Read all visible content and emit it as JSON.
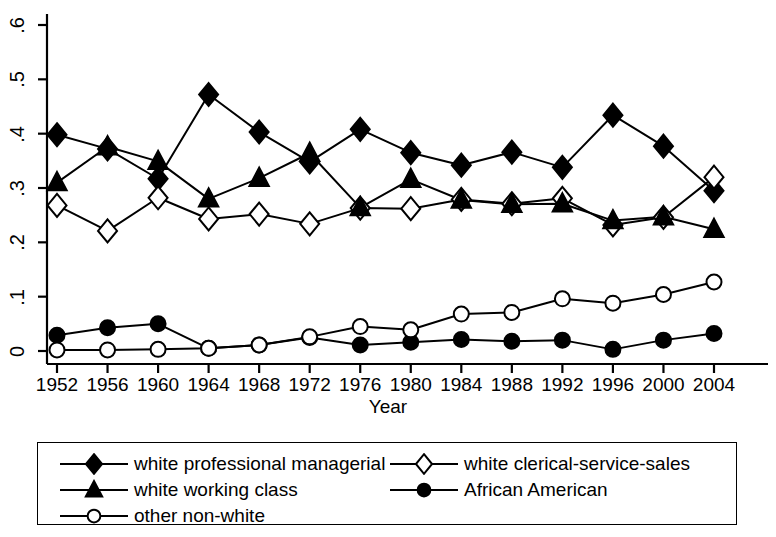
{
  "chart_data": {
    "type": "line",
    "title": "",
    "xlabel": "Year",
    "ylabel": "",
    "x": [
      1952,
      1956,
      1960,
      1964,
      1968,
      1972,
      1976,
      1980,
      1984,
      1988,
      1992,
      1996,
      2000,
      2004
    ],
    "xticklabels": [
      "1952",
      "1956",
      "1960",
      "1964",
      "1968",
      "1972",
      "1976",
      "1980",
      "1984",
      "1988",
      "1992",
      "1996",
      "2000",
      "2004"
    ],
    "yticklabels": [
      "0",
      ".1",
      ".2",
      ".3",
      ".4",
      ".5",
      ".6"
    ],
    "ytickvalues": [
      0,
      0.1,
      0.2,
      0.3,
      0.4,
      0.5,
      0.6
    ],
    "ylim": [
      0,
      0.6
    ],
    "xlim": [
      1952,
      2004
    ],
    "grid": false,
    "legend_position": "below-plot",
    "series": [
      {
        "name": "white professional managerial",
        "marker": "filled-diamond",
        "values": [
          0.398,
          0.372,
          0.317,
          0.472,
          0.403,
          0.348,
          0.408,
          0.365,
          0.342,
          0.366,
          0.338,
          0.434,
          0.377,
          0.295
        ]
      },
      {
        "name": "white clerical-service-sales",
        "marker": "open-diamond",
        "values": [
          0.268,
          0.221,
          0.282,
          0.243,
          0.252,
          0.234,
          0.263,
          0.262,
          0.279,
          0.271,
          0.281,
          0.232,
          0.246,
          0.32
        ]
      },
      {
        "name": "white working class",
        "marker": "filled-triangle",
        "values": [
          0.31,
          0.376,
          0.349,
          0.28,
          0.318,
          0.364,
          0.264,
          0.316,
          0.278,
          0.27,
          0.271,
          0.24,
          0.247,
          0.224
        ]
      },
      {
        "name": "African American",
        "marker": "filled-circle",
        "values": [
          0.029,
          0.043,
          0.05,
          0.005,
          0.011,
          0.025,
          0.011,
          0.016,
          0.021,
          0.018,
          0.02,
          0.003,
          0.02,
          0.032
        ]
      },
      {
        "name": "other non-white",
        "marker": "open-circle",
        "values": [
          0.002,
          0.002,
          0.003,
          0.005,
          0.011,
          0.026,
          0.045,
          0.039,
          0.068,
          0.071,
          0.096,
          0.088,
          0.104,
          0.127
        ]
      }
    ]
  },
  "legend": {
    "items": [
      {
        "label": "white professional managerial",
        "marker": "filled-diamond"
      },
      {
        "label": "white clerical-service-sales",
        "marker": "open-diamond"
      },
      {
        "label": "white working class",
        "marker": "filled-triangle"
      },
      {
        "label": "African American",
        "marker": "filled-circle"
      },
      {
        "label": "other non-white",
        "marker": "open-circle"
      }
    ]
  },
  "colors": {
    "line": "#000000",
    "marker_fill": "#000000",
    "marker_open_fill": "#ffffff",
    "axis": "#000000",
    "background": "#ffffff"
  }
}
